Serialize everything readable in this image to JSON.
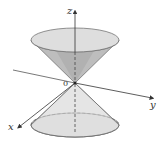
{
  "diagram": {
    "type": "double-cone",
    "labels": {
      "z_axis": "z",
      "y_axis": "y",
      "x_axis": "x",
      "origin": "0"
    },
    "colors": {
      "upper_cone_outer": "#c4c4c4",
      "upper_cone_inner": "#a8a8a8",
      "top_ellipse": "#dcdcdc",
      "lower_cone": "#e3e3e3",
      "bottom_ellipse": "#d6d6d6",
      "stroke": "#555555",
      "axis": "#333333"
    }
  }
}
